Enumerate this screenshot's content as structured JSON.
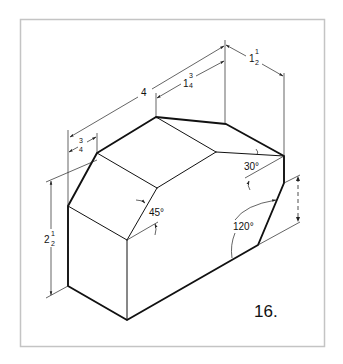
{
  "figure": {
    "number_label": "16."
  },
  "dimensions": {
    "overall_length": {
      "label": "4"
    },
    "top_offset": {
      "whole": "1",
      "num": "3",
      "den": "4"
    },
    "depth": {
      "whole": "1",
      "num": "1",
      "den": "2"
    },
    "left_chamfer": {
      "whole": "",
      "num": "3",
      "den": "4"
    },
    "height": {
      "whole": "2",
      "num": "1",
      "den": "2"
    }
  },
  "angles": {
    "a30": "30°",
    "a45": "45°",
    "a120": "120°"
  },
  "colors": {
    "line": "#111111",
    "frame": "#c4c4c4",
    "background": "#ffffff"
  }
}
